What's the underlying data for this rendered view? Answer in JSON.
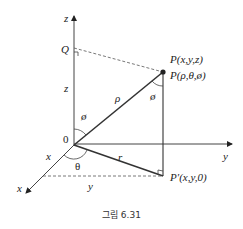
{
  "figure": {
    "caption": "그림 6.31",
    "axes": {
      "z_label": "z",
      "y_label": "y",
      "x_label": "x"
    },
    "points": {
      "Q_label": "Q",
      "P_cartesian": "P(x,y,z)",
      "P_spherical": "P(ρ,θ,ø)",
      "P_prime": "P′(x,y,0)",
      "origin": "0"
    },
    "segment_labels": {
      "z_height": "z",
      "rho": "ρ",
      "r": "r",
      "x_len": "x",
      "y_len": "y"
    },
    "angles": {
      "phi_at_origin": "ø",
      "phi_at_P": "ø",
      "theta": "θ"
    }
  }
}
